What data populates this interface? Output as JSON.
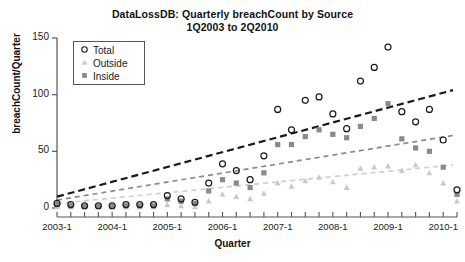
{
  "chart_data": {
    "type": "scatter",
    "title": "DataLossDB: Quarterly breachCount by Source\n1Q2003 to 2Q2010",
    "title_line1": "DataLossDB: Quarterly breachCount by Source",
    "title_line2": "1Q2003 to 2Q2010",
    "xlabel": "Quarter",
    "ylabel": "breachCount/Quarter",
    "xlim": [
      0,
      29
    ],
    "ylim": [
      0,
      150
    ],
    "yticks": [
      0,
      50,
      100,
      150
    ],
    "ytick_labels": [
      "0",
      "50",
      "100",
      "150"
    ],
    "xtick_labels": [
      "2003-1",
      "2004-1",
      "2005-1",
      "2006-1",
      "2007-1",
      "2008-1",
      "2009-1",
      "2010-1"
    ],
    "xtick_indices": [
      0,
      4,
      8,
      12,
      16,
      20,
      24,
      28
    ],
    "minor_tick_every_quarter": true,
    "grid": false,
    "legend_position": "upper-left",
    "legend": [
      {
        "label": "Total",
        "marker": "open-circle",
        "color": "#1a1a1a"
      },
      {
        "label": "Outside",
        "marker": "filled-triangle",
        "color": "#c8c8c8"
      },
      {
        "label": "Inside",
        "marker": "filled-square",
        "color": "#8a8a8a"
      }
    ],
    "x": [
      "1Q2003",
      "2Q2003",
      "3Q2003",
      "4Q2003",
      "1Q2004",
      "2Q2004",
      "3Q2004",
      "4Q2004",
      "1Q2005",
      "2Q2005",
      "3Q2005",
      "4Q2005",
      "1Q2006",
      "2Q2006",
      "3Q2006",
      "4Q2006",
      "1Q2007",
      "2Q2007",
      "3Q2007",
      "4Q2007",
      "1Q2008",
      "2Q2008",
      "3Q2008",
      "4Q2008",
      "1Q2009",
      "2Q2009",
      "3Q2009",
      "4Q2009",
      "1Q2010",
      "2Q2010"
    ],
    "series": [
      {
        "name": "Total",
        "marker": "open-circle",
        "color": "#1a1a1a",
        "values": [
          4,
          3,
          2,
          2,
          2,
          3,
          3,
          3,
          11,
          8,
          5,
          22,
          39,
          33,
          25,
          46,
          87,
          69,
          95,
          98,
          83,
          70,
          112,
          124,
          142,
          85,
          76,
          87,
          60,
          16
        ]
      },
      {
        "name": "Inside",
        "marker": "filled-square",
        "color": "#8a8a8a",
        "values": [
          3,
          2,
          2,
          2,
          2,
          2,
          2,
          2,
          8,
          6,
          4,
          15,
          25,
          22,
          18,
          31,
          56,
          56,
          63,
          69,
          65,
          62,
          72,
          79,
          92,
          61,
          53,
          50,
          36,
          12
        ]
      },
      {
        "name": "Outside",
        "marker": "filled-triangle",
        "color": "#c8c8c8",
        "values": [
          1,
          1,
          1,
          1,
          1,
          1,
          1,
          1,
          3,
          2,
          1,
          6,
          12,
          10,
          8,
          13,
          22,
          19,
          24,
          27,
          23,
          18,
          35,
          36,
          37,
          33,
          38,
          31,
          22,
          6
        ]
      }
    ],
    "trend_lines": [
      {
        "name": "Total trend",
        "color": "#1a1a1a",
        "y_start": 10,
        "y_end": 104,
        "style": "dashed",
        "width": 2.2
      },
      {
        "name": "Inside trend",
        "color": "#8a8a8a",
        "y_start": 7,
        "y_end": 64,
        "style": "dashed",
        "width": 1.7
      },
      {
        "name": "Outside trend",
        "color": "#cfcfcf",
        "y_start": 4,
        "y_end": 38,
        "style": "dashed",
        "width": 1.7
      }
    ]
  }
}
